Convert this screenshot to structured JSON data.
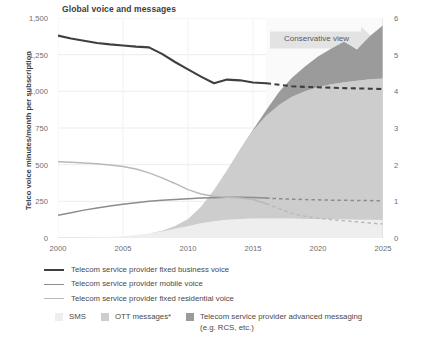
{
  "chart_data": {
    "type": "area",
    "title": "Global voice and messages",
    "xlabel": "",
    "ylabel": "Telco voice minutes/month per subscription",
    "y2label": "Global monthly messages (trillions)",
    "xlim": [
      2000,
      2025
    ],
    "ylim": [
      0,
      1500
    ],
    "y2lim": [
      0,
      6
    ],
    "grid": true,
    "legend_position": "below",
    "x_ticks": [
      "2000",
      "2005",
      "2010",
      "2015",
      "2020",
      "2025"
    ],
    "x_tick_values": [
      2000,
      2005,
      2010,
      2015,
      2020,
      2025
    ],
    "y_ticks": [
      "0",
      "250",
      "500",
      "750",
      "1,000",
      "1,250",
      "1,500"
    ],
    "y_tick_values": [
      0,
      250,
      500,
      750,
      1000,
      1250,
      1500
    ],
    "y2_ticks": [
      "0",
      "1",
      "2",
      "3",
      "4",
      "5",
      "6"
    ],
    "y2_tick_values": [
      0,
      1,
      2,
      3,
      4,
      5,
      6
    ],
    "annotations": [
      {
        "text": "Conservative view",
        "x": 2018.2,
        "y": 1400,
        "shape": "right-arrow-band"
      }
    ],
    "forecast_start": 2016,
    "x": [
      2000,
      2001,
      2002,
      2003,
      2004,
      2005,
      2006,
      2007,
      2008,
      2009,
      2010,
      2011,
      2012,
      2013,
      2014,
      2015,
      2016,
      2017,
      2018,
      2019,
      2020,
      2021,
      2022,
      2023,
      2024,
      2025
    ],
    "series": [
      {
        "name": "Telecom service provider fixed business voice",
        "axis": "left",
        "type": "line",
        "color": "#3f3f3f",
        "solid_until": 2016,
        "values": [
          1380,
          1360,
          1345,
          1330,
          1320,
          1312,
          1305,
          1300,
          1255,
          1200,
          1150,
          1100,
          1055,
          1080,
          1075,
          1060,
          1055,
          1045,
          1035,
          1030,
          1028,
          1025,
          1022,
          1020,
          1018,
          1015
        ]
      },
      {
        "name": "Telecom service provider mobile voice",
        "axis": "left",
        "type": "line",
        "color": "#8c8c8c",
        "solid_until": 2016,
        "values": [
          155,
          172,
          190,
          205,
          218,
          230,
          240,
          250,
          258,
          263,
          268,
          272,
          275,
          277,
          278,
          276,
          272,
          268,
          265,
          262,
          260,
          258,
          257,
          256,
          255,
          254
        ]
      },
      {
        "name": "Telecom service provider fixed residential voice",
        "axis": "left",
        "type": "line",
        "color": "#b9b9b9",
        "solid_until": 2016,
        "values": [
          520,
          516,
          512,
          506,
          498,
          488,
          470,
          444,
          410,
          372,
          330,
          300,
          285,
          278,
          272,
          262,
          235,
          200,
          168,
          148,
          135,
          126,
          118,
          110,
          102,
          95
        ]
      },
      {
        "name": "SMS",
        "axis": "right",
        "type": "area",
        "color": "#eeeeee",
        "values": [
          0.0,
          0.0,
          0.01,
          0.02,
          0.03,
          0.05,
          0.08,
          0.12,
          0.18,
          0.25,
          0.32,
          0.4,
          0.46,
          0.5,
          0.52,
          0.53,
          0.53,
          0.53,
          0.53,
          0.52,
          0.52,
          0.51,
          0.51,
          0.5,
          0.5,
          0.49
        ]
      },
      {
        "name": "OTT messages*",
        "axis": "right",
        "type": "area",
        "color": "#cdcdcd",
        "values": [
          0.0,
          0.0,
          0.0,
          0.0,
          0.0,
          0.0,
          0.0,
          0.0,
          0.02,
          0.08,
          0.2,
          0.45,
          0.85,
          1.35,
          1.9,
          2.4,
          2.8,
          3.1,
          3.32,
          3.48,
          3.6,
          3.68,
          3.74,
          3.79,
          3.83,
          3.86
        ]
      },
      {
        "name": "Telecom service provider advanced messaging (e.g. RCS, etc.)",
        "axis": "right",
        "type": "area",
        "color": "#9b9b9b",
        "values": [
          0.0,
          0.0,
          0.0,
          0.0,
          0.0,
          0.0,
          0.0,
          0.0,
          0.0,
          0.0,
          0.0,
          0.0,
          0.0,
          0.0,
          0.0,
          0.02,
          0.15,
          0.35,
          0.52,
          0.68,
          0.83,
          0.97,
          1.1,
          0.85,
          1.18,
          1.45
        ]
      }
    ]
  },
  "title": "Global voice and messages",
  "axes": {
    "left_title": "Telco voice minutes/month per subscription",
    "right_title": "Global monthly messages (trillions)"
  },
  "annotation": {
    "conservative_view": "Conservative view"
  },
  "legend": {
    "lines": [
      {
        "label": "Telecom service provider fixed business voice",
        "color": "#3f3f3f",
        "width": "2.2px"
      },
      {
        "label": "Telecom service provider mobile voice",
        "color": "#8c8c8c",
        "width": "1.4px"
      },
      {
        "label": "Telecom service provider fixed residential voice",
        "color": "#b9b9b9",
        "width": "1.4px"
      }
    ],
    "areas": [
      {
        "label": "SMS",
        "label2": "",
        "color": "#eeeeee"
      },
      {
        "label": "OTT messages*",
        "label2": "",
        "color": "#cdcdcd"
      },
      {
        "label": "Telecom service provider advanced messaging",
        "label2": "(e.g. RCS, etc.)",
        "color": "#9b9b9b"
      }
    ]
  }
}
